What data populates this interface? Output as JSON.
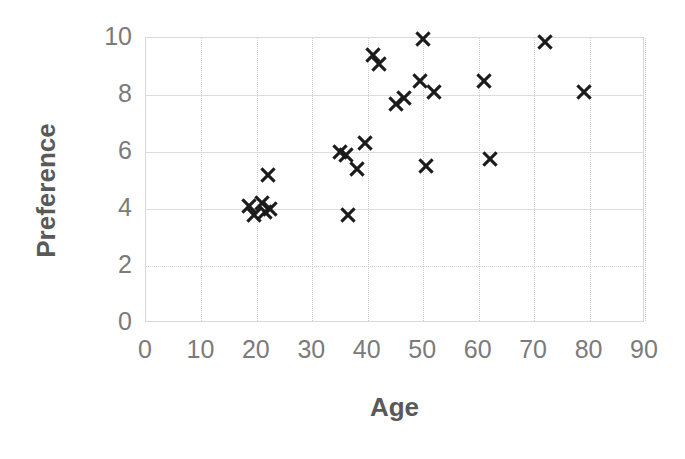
{
  "chart_data": {
    "type": "scatter",
    "title": "",
    "xlabel": "Age",
    "ylabel": "Preference",
    "xlim": [
      0,
      90
    ],
    "ylim": [
      0,
      10
    ],
    "xticks": [
      0,
      10,
      20,
      30,
      40,
      50,
      60,
      70,
      80,
      90
    ],
    "yticks": [
      0,
      2,
      4,
      6,
      8,
      10
    ],
    "xtick_labels": [
      "0",
      "10",
      "20",
      "30",
      "40",
      "50",
      "60",
      "70",
      "80",
      "90"
    ],
    "ytick_labels": [
      "0",
      "2",
      "4",
      "6",
      "8",
      "10"
    ],
    "grid": true,
    "legend": false,
    "marker": "x",
    "marker_color": "#1b1b1b",
    "series": [
      {
        "name": "Preference by Age",
        "points": [
          {
            "x": 18.5,
            "y": 4.1
          },
          {
            "x": 19.5,
            "y": 3.8
          },
          {
            "x": 21.0,
            "y": 4.2
          },
          {
            "x": 21.5,
            "y": 3.9
          },
          {
            "x": 22.0,
            "y": 5.2
          },
          {
            "x": 22.3,
            "y": 4.0
          },
          {
            "x": 35.0,
            "y": 6.0
          },
          {
            "x": 36.0,
            "y": 5.9
          },
          {
            "x": 36.5,
            "y": 3.8
          },
          {
            "x": 38.0,
            "y": 5.4
          },
          {
            "x": 39.5,
            "y": 6.3
          },
          {
            "x": 41.0,
            "y": 9.4
          },
          {
            "x": 42.0,
            "y": 9.1
          },
          {
            "x": 45.0,
            "y": 7.7
          },
          {
            "x": 46.5,
            "y": 7.9
          },
          {
            "x": 49.5,
            "y": 8.5
          },
          {
            "x": 50.0,
            "y": 9.95
          },
          {
            "x": 50.5,
            "y": 5.5
          },
          {
            "x": 52.0,
            "y": 8.1
          },
          {
            "x": 61.0,
            "y": 8.5
          },
          {
            "x": 62.0,
            "y": 5.75
          },
          {
            "x": 72.0,
            "y": 9.85
          },
          {
            "x": 79.0,
            "y": 8.1
          }
        ]
      }
    ]
  },
  "axis": {
    "x_title": "Age",
    "y_title": "Preference"
  },
  "colors": {
    "marker": "#1b1b1b",
    "tick_label": "#7b7b7b",
    "axis_title": "#595959",
    "gridline": "#d2d2d2",
    "plot_border": "#d9d9d9",
    "background": "#ffffff"
  }
}
